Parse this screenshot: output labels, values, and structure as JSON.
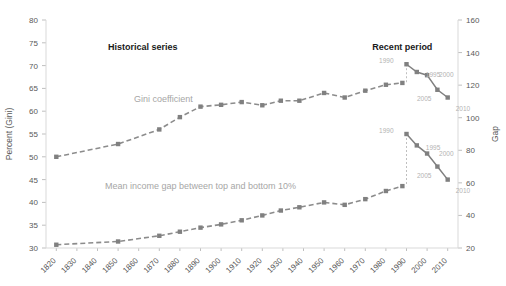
{
  "chart_data": {
    "type": "line",
    "title": "",
    "xlabel": "",
    "ylabel": "Percent (Gini)",
    "y2label": "Gap",
    "ylim": [
      30,
      80
    ],
    "y2lim": [
      20,
      160
    ],
    "grid": false,
    "legend": "none",
    "x_ticks": [
      "1820",
      "1830",
      "1840",
      "1850",
      "1860",
      "1870",
      "1880",
      "1890",
      "1900",
      "1910",
      "1920",
      "1930",
      "1940",
      "1950",
      "1960",
      "1970",
      "1980",
      "1990",
      "2000",
      "2010"
    ],
    "y_ticks": [
      "30",
      "35",
      "40",
      "45",
      "50",
      "55",
      "60",
      "65",
      "70",
      "75",
      "80"
    ],
    "y2_ticks": [
      "20",
      "40",
      "60",
      "80",
      "100",
      "120",
      "140",
      "160"
    ],
    "annotations": [
      {
        "name": "historical-series-label",
        "text": "Historical series",
        "x": 1862,
        "y_axis": "left",
        "y": 73.5,
        "style": "bold"
      },
      {
        "name": "recent-period-label",
        "text": "Recent period",
        "x": 1988,
        "y_axis": "left",
        "y": 73.5,
        "style": "bold"
      },
      {
        "name": "gini-series-label",
        "text": "Gini coefficient",
        "x": 1872,
        "y_axis": "left",
        "y": 62.0,
        "style": "gray"
      },
      {
        "name": "gap-series-label",
        "text": "Mean income gap between top and bottom 10%",
        "x": 1890,
        "y_axis": "left",
        "y": 43.0,
        "style": "gray"
      }
    ],
    "series": [
      {
        "name": "Gini coefficient (historical)",
        "axis": "left",
        "style": "dashed",
        "x": [
          1820,
          1850,
          1870,
          1880,
          1890,
          1900,
          1910,
          1920,
          1929,
          1938,
          1950,
          1960,
          1970,
          1980,
          1988
        ],
        "values": [
          50.0,
          52.8,
          56.0,
          58.7,
          61.0,
          61.4,
          62.0,
          61.3,
          62.3,
          62.3,
          64.0,
          63.0,
          64.5,
          65.8,
          66.2
        ]
      },
      {
        "name": "Mean income gap between top and bottom 10% (historical)",
        "axis": "right",
        "style": "dashed",
        "x": [
          1820,
          1850,
          1870,
          1880,
          1890,
          1900,
          1910,
          1920,
          1929,
          1938,
          1950,
          1960,
          1970,
          1980,
          1988
        ],
        "values": [
          22.0,
          24.0,
          27.5,
          30.0,
          32.5,
          34.5,
          37.0,
          40.0,
          43.0,
          45.0,
          48.0,
          46.5,
          50.0,
          55.0,
          58.0
        ]
      },
      {
        "name": "Gini coefficient (recent period)",
        "axis": "left",
        "style": "solid",
        "x": [
          1990,
          1995,
          2000,
          2005,
          2010
        ],
        "values": [
          70.3,
          68.6,
          67.9,
          64.7,
          63.0
        ],
        "point_labels": [
          "1990",
          "1995",
          "2000",
          "2005",
          "2010"
        ]
      },
      {
        "name": "Mean income gap (recent period)",
        "axis": "right",
        "style": "solid",
        "x": [
          1990,
          1995,
          2000,
          2005,
          2010
        ],
        "values": [
          90.0,
          83.0,
          78.0,
          70.0,
          62.0
        ],
        "point_labels": [
          "1990",
          "1995",
          "2000",
          "2005",
          "2010"
        ]
      }
    ],
    "connectors": [
      {
        "name": "gini-connector",
        "x": 1990,
        "from_left": 70.3,
        "to_left": 66.2
      },
      {
        "name": "gap-connector",
        "x": 1990,
        "from_right": 90.0,
        "to_right": 58.0
      }
    ]
  }
}
